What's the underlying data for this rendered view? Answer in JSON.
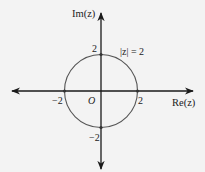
{
  "diagram": {
    "axes": {
      "x_label": "Re(z)",
      "y_label": "Im(z)",
      "origin_label": "O"
    },
    "circle": {
      "label": "|z| = 2",
      "radius_value": 2
    },
    "ticks": {
      "x_pos": "2",
      "x_neg": "−2",
      "y_pos": "2",
      "y_neg": "−2"
    },
    "colors": {
      "background": "#f3f3f3",
      "axis": "#1a1a1a",
      "circle": "#555555",
      "text": "#222222"
    }
  }
}
